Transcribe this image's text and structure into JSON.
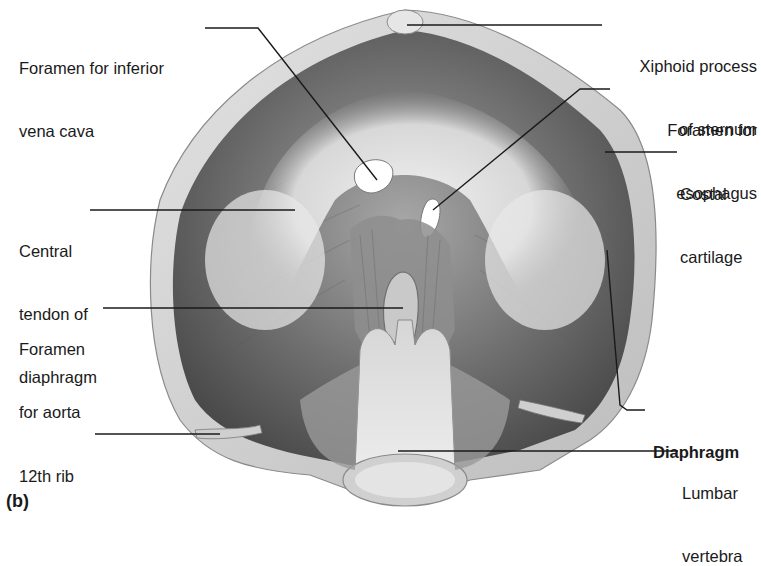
{
  "figure": {
    "panel_label": "(b)",
    "labels_left": [
      {
        "id": "ivc",
        "lines": [
          "Foramen for inferior",
          "vena cava"
        ]
      },
      {
        "id": "central-tendon",
        "lines": [
          "Central",
          "tendon of",
          "diaphragm"
        ]
      },
      {
        "id": "aorta",
        "lines": [
          "Foramen",
          "for aorta"
        ]
      },
      {
        "id": "rib12",
        "lines": [
          "12th rib"
        ]
      }
    ],
    "labels_right": [
      {
        "id": "xiphoid",
        "lines": [
          "Xiphoid process",
          "of sternum"
        ]
      },
      {
        "id": "esophagus",
        "lines": [
          "Foramen for",
          "esophagus"
        ]
      },
      {
        "id": "costal",
        "lines": [
          "Costal",
          "cartilage"
        ]
      },
      {
        "id": "diaphragm",
        "lines": [
          "Diaphragm"
        ],
        "bold": true
      },
      {
        "id": "lumbar",
        "lines": [
          "Lumbar",
          "vertebra"
        ]
      }
    ]
  }
}
